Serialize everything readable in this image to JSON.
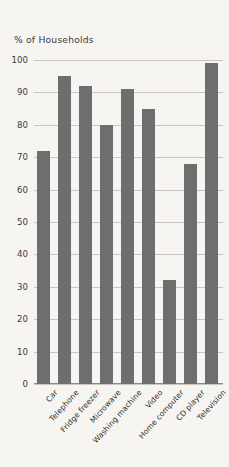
{
  "chart_data": {
    "type": "bar",
    "title": "% of Households",
    "xlabel": "",
    "ylabel": "% of Households",
    "ylim": [
      0,
      100
    ],
    "ytick_step": 10,
    "grid": true,
    "legend": "none",
    "bar_color": "#6e6e6e",
    "background_color": "#f7f5f2",
    "gridline_color": "#c9c6c1",
    "categories": [
      "Car",
      "Telephone",
      "Fridge freezer",
      "Microwave",
      "Washing machine",
      "Video",
      "Home computer",
      "CD player",
      "Television"
    ],
    "values": [
      72,
      95,
      92,
      80,
      91,
      85,
      32,
      68,
      99
    ],
    "ytick_labels": [
      "100",
      "90",
      "80",
      "70",
      "60",
      "50",
      "40",
      "30",
      "20",
      "10",
      "0"
    ],
    "ytick_values": [
      100,
      90,
      80,
      70,
      60,
      50,
      40,
      30,
      20,
      10,
      0
    ]
  }
}
